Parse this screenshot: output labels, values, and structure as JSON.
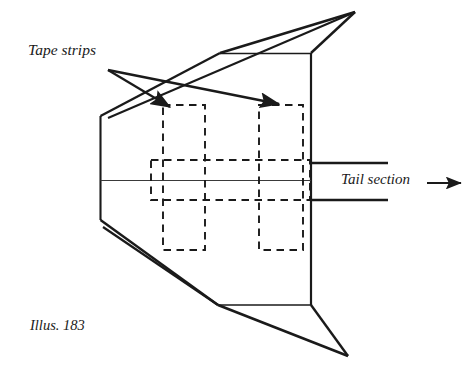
{
  "figure": {
    "caption": "Illus. 183",
    "labels": {
      "tape_strips": "Tape strips",
      "tail_section": "Tail section"
    },
    "colors": {
      "ink": "#1a1a1a",
      "background": "#ffffff",
      "thin_line": "#3a3a3a"
    },
    "annotations": [
      {
        "name": "tape-strip-left",
        "kind": "dashed-rectangle",
        "x": 163,
        "y": 105,
        "width": 42,
        "height": 145
      },
      {
        "name": "tape-strip-right",
        "kind": "dashed-rectangle",
        "x": 259,
        "y": 105,
        "width": 44,
        "height": 145
      },
      {
        "name": "tape-strip-horizontal",
        "kind": "dashed-rectangle",
        "x": 151,
        "y": 160,
        "width": 159,
        "height": 40
      }
    ],
    "pointers": [
      {
        "name": "arrow-to-left-tape-strip",
        "from_x": 108,
        "from_y": 70,
        "to_x": 171,
        "to_y": 108
      },
      {
        "name": "arrow-to-right-tape-strip",
        "from_x": 108,
        "from_y": 70,
        "to_x": 280,
        "to_y": 105
      },
      {
        "name": "arrow-tail-section",
        "from_x": 427,
        "from_y": 183,
        "to_x": 462,
        "to_y": 183
      }
    ],
    "body_outline": {
      "nose_top_vertex": {
        "x": 100,
        "y": 116
      },
      "nose_bottom_vertex": {
        "x": 100,
        "y": 220
      },
      "right_edge_x": 311,
      "right_edge_top_y": 53,
      "right_edge_bottom_y": 305,
      "spine_y": 180
    },
    "wings": {
      "top_tip": {
        "x": 355,
        "y": 12
      },
      "top_shoulder": {
        "x": 220,
        "y": 53
      },
      "bottom_tip": {
        "x": 348,
        "y": 356
      },
      "bottom_shoulder": {
        "x": 218,
        "y": 305
      }
    },
    "tail_lines": [
      {
        "name": "tail-line-upper",
        "x1": 311,
        "y1": 163,
        "x2": 388,
        "y2": 163
      },
      {
        "name": "tail-line-lower",
        "x1": 311,
        "y1": 200,
        "x2": 388,
        "y2": 200
      }
    ]
  }
}
